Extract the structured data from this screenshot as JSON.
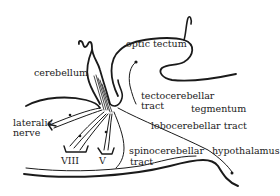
{
  "diagram": {
    "type": "anatomical-schematic",
    "colors": {
      "ink": "#1a1a1a",
      "background": "#ffffff"
    },
    "labels": {
      "optic_tectum": "optic tectum",
      "cerebellum": "cerebellum",
      "tectocerebellar_line1": "tectocerebellar",
      "tectocerebellar_line2": "tract",
      "tegmentum": "tegmentum",
      "lobocerebellar": "lobocerebellar tract",
      "lateralis_line1": "lateralis",
      "lateralis_line2": "nerve",
      "nerve_viii": "VIII",
      "nerve_v": "V",
      "spinocerebellar_line1": "spinocerebellar",
      "spinocerebellar_line2": "tract",
      "hypothalamus": "hypothalamus"
    }
  }
}
